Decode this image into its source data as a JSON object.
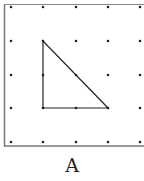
{
  "diagram": {
    "type": "geoboard-dot-grid",
    "label": "A",
    "border_color": "#777777",
    "line_color": "#222222",
    "dot_color": "#222222",
    "grid": {
      "cols": 5,
      "rows": 5,
      "x_positions": [
        11,
        43,
        76,
        108,
        140
      ],
      "y_positions": [
        7,
        41,
        75,
        108,
        142
      ]
    },
    "shape": {
      "kind": "right-triangle",
      "vertices_grid": [
        [
          1,
          1
        ],
        [
          1,
          3
        ],
        [
          3,
          3
        ]
      ],
      "vertices_px": [
        [
          43,
          41
        ],
        [
          43,
          108
        ],
        [
          108,
          108
        ]
      ]
    }
  }
}
